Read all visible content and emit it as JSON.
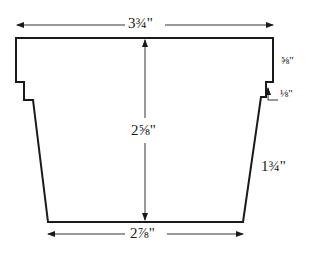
{
  "diagram": {
    "colors": {
      "line": "#1a1a1a",
      "dim_line": "#333333",
      "background": "#ffffff"
    },
    "dimensions": {
      "top_width": "3¾\"",
      "bottom_width": "2⅞\"",
      "height": "2⅝\"",
      "rim_height": "⅝\"",
      "step": "⅛\"",
      "slant_side": "1¾\""
    }
  }
}
